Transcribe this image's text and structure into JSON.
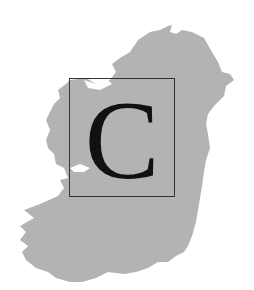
{
  "figure": {
    "initial_letter": "C",
    "colors": {
      "background": "#ffffff",
      "map_fill": "#b3b3b3",
      "box_border": "#333333",
      "letter": "#111111"
    }
  }
}
